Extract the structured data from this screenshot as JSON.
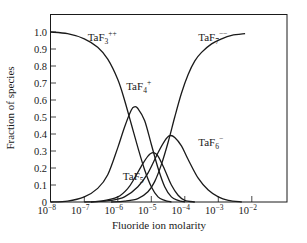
{
  "chart_data": {
    "type": "line",
    "title": "",
    "xlabel": "Fluoride ion molarity",
    "ylabel": "Fraction of species",
    "xscale": "log",
    "xlim_log10": [
      -8,
      -1
    ],
    "ylim": [
      0,
      1.1
    ],
    "x_ticks": [
      {
        "exp": -8,
        "label": "10",
        "sup": "−8"
      },
      {
        "exp": -7,
        "label": "10",
        "sup": "−7"
      },
      {
        "exp": -6,
        "label": "10",
        "sup": "−6"
      },
      {
        "exp": -5,
        "label": "10",
        "sup": "−5"
      },
      {
        "exp": -4,
        "label": "10",
        "sup": "−4"
      },
      {
        "exp": -3,
        "label": "10",
        "sup": "−3"
      },
      {
        "exp": -2,
        "label": "10",
        "sup": "−2"
      }
    ],
    "y_ticks": [
      "0",
      "0.1",
      "0.2",
      "0.3",
      "0.4",
      "0.5",
      "0.6",
      "0.7",
      "0.8",
      "0.9",
      "1.0"
    ],
    "grid": false,
    "legend": "inline labels",
    "series": [
      {
        "name": "TaF3++",
        "label_base": "TaF",
        "label_sub": "3",
        "label_sup": "++",
        "label_pos_log10": -6.9,
        "label_pos_y": 0.95,
        "x_log10": [
          -8.0,
          -7.5,
          -7.0,
          -6.6,
          -6.3,
          -6.0,
          -5.8,
          -5.6,
          -5.4,
          -5.2,
          -5.0,
          -4.8,
          -4.6,
          -4.4
        ],
        "values": [
          1.0,
          0.99,
          0.96,
          0.91,
          0.84,
          0.72,
          0.6,
          0.46,
          0.32,
          0.19,
          0.09,
          0.03,
          0.01,
          0.0
        ]
      },
      {
        "name": "TaF4+",
        "label_base": "TaF",
        "label_sub": "4",
        "label_sup": "+",
        "label_pos_log10": -5.75,
        "label_pos_y": 0.66,
        "x_log10": [
          -8.0,
          -7.5,
          -7.0,
          -6.6,
          -6.3,
          -6.0,
          -5.8,
          -5.6,
          -5.5,
          -5.4,
          -5.2,
          -5.0,
          -4.8,
          -4.6,
          -4.4,
          -4.2,
          -4.0
        ],
        "values": [
          0.0,
          0.005,
          0.03,
          0.08,
          0.16,
          0.32,
          0.44,
          0.54,
          0.56,
          0.55,
          0.48,
          0.34,
          0.2,
          0.09,
          0.03,
          0.01,
          0.0
        ]
      },
      {
        "name": "TaF5",
        "label_base": "TaF",
        "label_sub": "5",
        "label_sup": "",
        "label_pos_log10": -5.85,
        "label_pos_y": 0.13,
        "x_log10": [
          -7.0,
          -6.5,
          -6.0,
          -5.7,
          -5.5,
          -5.3,
          -5.1,
          -4.95,
          -4.8,
          -4.6,
          -4.4,
          -4.2,
          -4.0,
          -3.7
        ],
        "values": [
          0.0,
          0.005,
          0.03,
          0.08,
          0.14,
          0.21,
          0.27,
          0.29,
          0.27,
          0.19,
          0.1,
          0.04,
          0.01,
          0.0
        ]
      },
      {
        "name": "TaF6-",
        "label_base": "TaF",
        "label_sub": "6",
        "label_sup": "−",
        "label_pos_log10": -3.6,
        "label_pos_y": 0.33,
        "x_log10": [
          -6.8,
          -6.2,
          -5.8,
          -5.4,
          -5.1,
          -4.8,
          -4.6,
          -4.45,
          -4.3,
          -4.1,
          -3.9,
          -3.6,
          -3.3,
          -3.0,
          -2.7,
          -2.3
        ],
        "values": [
          0.0,
          0.01,
          0.03,
          0.09,
          0.17,
          0.29,
          0.36,
          0.39,
          0.38,
          0.33,
          0.25,
          0.14,
          0.07,
          0.03,
          0.01,
          0.0
        ]
      },
      {
        "name": "TaF7--",
        "label_base": "TaF",
        "label_sub": "7",
        "label_sup": "−−",
        "label_pos_log10": -3.6,
        "label_pos_y": 0.95,
        "x_log10": [
          -6.2,
          -5.8,
          -5.4,
          -5.1,
          -4.9,
          -4.7,
          -4.5,
          -4.3,
          -4.1,
          -3.9,
          -3.7,
          -3.5,
          -3.2,
          -2.9,
          -2.6,
          -2.2
        ],
        "values": [
          0.0,
          0.005,
          0.02,
          0.06,
          0.12,
          0.22,
          0.35,
          0.5,
          0.64,
          0.75,
          0.83,
          0.88,
          0.93,
          0.96,
          0.98,
          0.99
        ]
      }
    ]
  },
  "colors": {
    "line": "#1a1a1a",
    "background": "#ffffff"
  }
}
